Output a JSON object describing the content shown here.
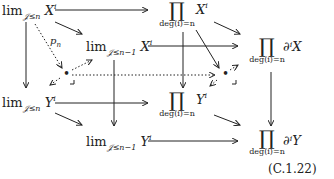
{
  "diagram": {
    "nodes": {
      "limXn": {
        "base": "lim",
        "sub": "𝒥≤n",
        "obj": "X",
        "sup": "i"
      },
      "limXn1": {
        "base": "lim",
        "sub": "𝒥≤n−1",
        "obj": "X",
        "sup": "i"
      },
      "prodX": {
        "symbol": "∏",
        "under": "deg(i)=n",
        "obj": "X",
        "sup": "i"
      },
      "prodDX": {
        "symbol": "∏",
        "under": "deg(i)=n",
        "obj": "∂ⁱX"
      },
      "limYn": {
        "base": "lim",
        "sub": "𝒥≤n",
        "obj": "Y",
        "sup": "i"
      },
      "limYn1": {
        "base": "lim",
        "sub": "𝒥≤n−1",
        "obj": "Y",
        "sup": "i"
      },
      "prodY": {
        "symbol": "∏",
        "under": "deg(i)=n",
        "obj": "Y",
        "sup": "i"
      },
      "prodDY": {
        "symbol": "∏",
        "under": "deg(i)=n",
        "obj": "∂ⁱY"
      },
      "pb1": {
        "symbol": "•"
      },
      "pb2": {
        "symbol": "•"
      }
    },
    "labels": {
      "pn": "p",
      "pn_sub": "n"
    },
    "equation_number": "(C.1.22)",
    "colors": {
      "ink": "#222222",
      "background": "#ffffff"
    }
  }
}
